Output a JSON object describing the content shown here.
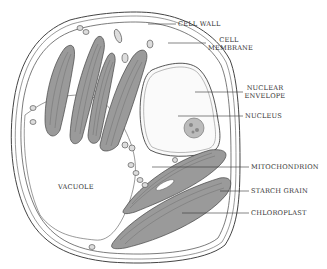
{
  "diagram": {
    "labels": {
      "cell_wall": "CELL WALL",
      "cell_membrane_1": "CELL",
      "cell_membrane_2": "MEMBRANE",
      "nuclear_envelope_1": "NUCLEAR",
      "nuclear_envelope_2": "ENVELOPE",
      "nucleus": "NUCLEUS",
      "mitochondrion": "MITOCHONDRION",
      "starch_grain": "STARCH GRAIN",
      "chloroplast": "CHLOROPLAST",
      "vacuole": "VACUOLE"
    },
    "colors": {
      "outline": "#444444",
      "chloroplast_fill": "#9a9a9a",
      "chloroplast_inner": "#7d7d7d",
      "background": "#ffffff",
      "text": "#333333"
    }
  }
}
